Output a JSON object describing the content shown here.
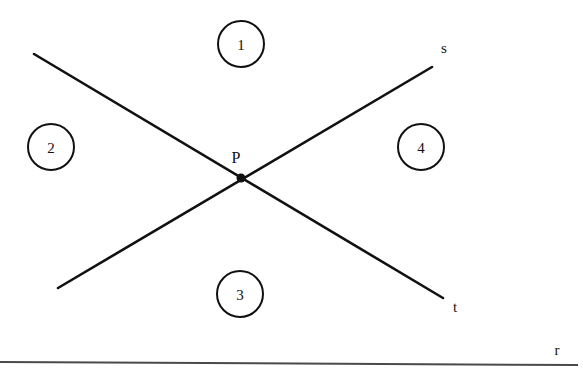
{
  "figure": {
    "canvas": {
      "width": 583,
      "height": 381,
      "background": "#ffffff"
    },
    "ink_color": "#111111",
    "baseline_color": "#4a4a4a"
  },
  "point": {
    "name": "P",
    "label": "P",
    "label_x": 236,
    "label_y": 157,
    "x": 241,
    "y": 178,
    "dot_radius": 4.5
  },
  "lines": [
    {
      "id": "t",
      "label": "t",
      "label_x": 455,
      "label_y": 307,
      "x1": 34,
      "y1": 54,
      "x2": 443,
      "y2": 298,
      "stroke_width": 2.6
    },
    {
      "id": "s",
      "label": "s",
      "label_x": 444,
      "label_y": 48,
      "x1": 58,
      "y1": 288,
      "x2": 432,
      "y2": 67,
      "stroke_width": 2.6
    },
    {
      "id": "r",
      "label": "r",
      "label_x": 557,
      "label_y": 350,
      "x1": 0,
      "y1": 362,
      "x2": 578,
      "y2": 365,
      "stroke_width": 2
    }
  ],
  "regions": [
    {
      "id": "region-1",
      "label": "1",
      "cx": 241,
      "cy": 44,
      "r": 23
    },
    {
      "id": "region-2",
      "label": "2",
      "cx": 51,
      "cy": 147,
      "r": 23
    },
    {
      "id": "region-3",
      "label": "3",
      "cx": 240,
      "cy": 294,
      "r": 23
    },
    {
      "id": "region-4",
      "label": "4",
      "cx": 421,
      "cy": 147,
      "r": 23
    }
  ]
}
